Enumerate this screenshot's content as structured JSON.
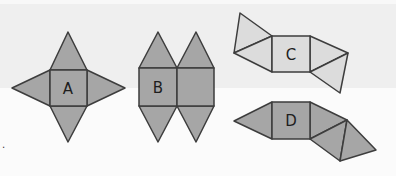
{
  "figure": {
    "nets": [
      {
        "id": "A",
        "label": "A",
        "fill": "#a6a6a6"
      },
      {
        "id": "B",
        "label": "B",
        "fill": "#a6a6a6"
      },
      {
        "id": "C",
        "label": "C",
        "fill": "#dcdcdc"
      },
      {
        "id": "D",
        "label": "D",
        "fill": "#a6a6a6"
      }
    ],
    "stroke": "#3d3d3d",
    "stray_mark": "."
  }
}
